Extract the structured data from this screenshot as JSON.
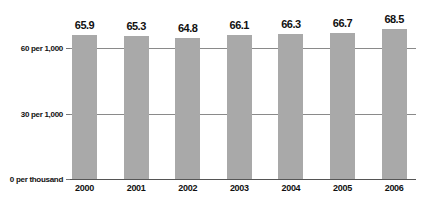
{
  "chart_data": {
    "type": "bar",
    "title": "",
    "xlabel": "",
    "ylabel": "",
    "categories": [
      "2000",
      "2001",
      "2002",
      "2003",
      "2004",
      "2005",
      "2006"
    ],
    "values": [
      65.9,
      65.3,
      64.8,
      66.1,
      66.3,
      66.7,
      68.5
    ],
    "value_labels": [
      "65.9",
      "65.3",
      "64.8",
      "66.1",
      "66.3",
      "66.7",
      "68.5"
    ],
    "ylim": [
      0,
      70
    ],
    "yticks": [
      {
        "value": 0,
        "label": "0 per thousand"
      },
      {
        "value": 30,
        "label": "30 per 1,000"
      },
      {
        "value": 60,
        "label": "60 per 1,000"
      }
    ],
    "grid": true,
    "legend": null,
    "colors": {
      "bar": "#a9a9a9",
      "grid": "#8a8a8a",
      "text": "#111111"
    }
  }
}
